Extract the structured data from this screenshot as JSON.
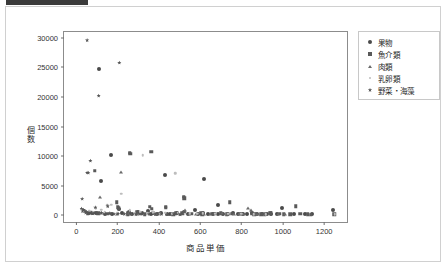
{
  "titlebar": {
    "text": ""
  },
  "chart_data": {
    "type": "scatter",
    "title": "",
    "xlabel": "商品単価",
    "ylabel": "個数",
    "xlim": [
      -60,
      1320
    ],
    "ylim": [
      -1500,
      31000
    ],
    "grid": false,
    "legend_position": "right",
    "xticks": [
      "0",
      "200",
      "400",
      "600",
      "800",
      "1000",
      "1200"
    ],
    "xtick_values": [
      0,
      200,
      400,
      600,
      800,
      1000,
      1200
    ],
    "yticks": [
      "0",
      "5000",
      "10000",
      "15000",
      "20000",
      "25000",
      "30000"
    ],
    "ytick_values": [
      0,
      5000,
      10000,
      15000,
      20000,
      25000,
      30000
    ],
    "series": [
      {
        "name": "果物",
        "marker": "circle",
        "color": "#4a4a4a",
        "points": [
          [
            108,
            24800
          ],
          [
            168,
            10100
          ],
          [
            118,
            5750
          ],
          [
            428,
            6850
          ],
          [
            618,
            6200
          ],
          [
            688,
            1800
          ],
          [
            995,
            1150
          ],
          [
            1242,
            950
          ],
          [
            205,
            1000
          ],
          [
            253,
            600
          ],
          [
            300,
            450
          ],
          [
            345,
            700
          ],
          [
            372,
            300
          ],
          [
            408,
            350
          ],
          [
            452,
            250
          ],
          [
            520,
            480
          ],
          [
            575,
            850
          ],
          [
            612,
            300
          ],
          [
            660,
            250
          ],
          [
            712,
            200
          ],
          [
            760,
            300
          ],
          [
            805,
            150
          ],
          [
            852,
            400
          ],
          [
            900,
            200
          ],
          [
            940,
            150
          ],
          [
            1052,
            250
          ],
          [
            1105,
            180
          ],
          [
            1140,
            120
          ],
          [
            95,
            300
          ],
          [
            140,
            250
          ],
          [
            62,
            420
          ],
          [
            75,
            350
          ],
          [
            172,
            260
          ],
          [
            222,
            380
          ],
          [
            268,
            220
          ],
          [
            318,
            300
          ],
          [
            362,
            180
          ],
          [
            392,
            240
          ],
          [
            438,
            160
          ],
          [
            485,
            280
          ],
          [
            540,
            200
          ],
          [
            588,
            170
          ],
          [
            636,
            220
          ],
          [
            684,
            140
          ],
          [
            735,
            190
          ],
          [
            782,
            160
          ],
          [
            828,
            130
          ],
          [
            875,
            210
          ],
          [
            925,
            150
          ],
          [
            972,
            120
          ]
        ]
      },
      {
        "name": "魚介類",
        "marker": "square",
        "color": "#595959",
        "points": [
          [
            362,
            10750
          ],
          [
            258,
            10600
          ],
          [
            260,
            10350
          ],
          [
            88,
            7500
          ],
          [
            520,
            3100
          ],
          [
            522,
            2900
          ],
          [
            196,
            2150
          ],
          [
            742,
            2200
          ],
          [
            1062,
            1500
          ],
          [
            355,
            1450
          ],
          [
            432,
            1400
          ],
          [
            432,
            1250
          ],
          [
            365,
            1050
          ],
          [
            200,
            1300
          ],
          [
            205,
            1150
          ],
          [
            292,
            500
          ],
          [
            938,
            400
          ],
          [
            942,
            300
          ],
          [
            512,
            350
          ],
          [
            558,
            250
          ],
          [
            605,
            300
          ],
          [
            655,
            200
          ],
          [
            700,
            350
          ],
          [
            752,
            250
          ],
          [
            800,
            200
          ],
          [
            848,
            300
          ],
          [
            895,
            180
          ],
          [
            985,
            250
          ],
          [
            1035,
            150
          ],
          [
            1085,
            200
          ],
          [
            1135,
            100
          ],
          [
            1248,
            180
          ],
          [
            55,
            280
          ],
          [
            105,
            320
          ],
          [
            152,
            260
          ],
          [
            248,
            300
          ],
          [
            308,
            220
          ],
          [
            400,
            260
          ],
          [
            470,
            180
          ],
          [
            480,
            330
          ],
          [
            610,
            160
          ],
          [
            670,
            240
          ],
          [
            728,
            140
          ],
          [
            790,
            220
          ],
          [
            860,
            120
          ],
          [
            912,
            180
          ],
          [
            1005,
            130
          ],
          [
            1120,
            160
          ],
          [
            248,
            150
          ],
          [
            330,
            140
          ]
        ]
      },
      {
        "name": "肉類",
        "marker": "triangle",
        "color": "#6a6a6a",
        "points": [
          [
            218,
            7300
          ],
          [
            112,
            3150
          ],
          [
            528,
            900
          ],
          [
            830,
            1150
          ],
          [
            845,
            900
          ],
          [
            255,
            350
          ],
          [
            262,
            250
          ],
          [
            348,
            300
          ],
          [
            438,
            200
          ],
          [
            545,
            250
          ],
          [
            620,
            180
          ],
          [
            705,
            300
          ],
          [
            762,
            150
          ],
          [
            805,
            200
          ],
          [
            868,
            250
          ],
          [
            920,
            130
          ],
          [
            975,
            180
          ],
          [
            1012,
            150
          ],
          [
            118,
            420
          ],
          [
            165,
            300
          ],
          [
            195,
            250
          ],
          [
            295,
            180
          ],
          [
            385,
            220
          ],
          [
            465,
            160
          ],
          [
            500,
            150
          ],
          [
            578,
            140
          ],
          [
            645,
            190
          ],
          [
            728,
            120
          ],
          [
            785,
            160
          ],
          [
            880,
            110
          ]
        ]
      },
      {
        "name": "乳卵類",
        "marker": "dot",
        "color": "#bdbdbd",
        "points": [
          [
            322,
            10100
          ],
          [
            478,
            7050
          ],
          [
            218,
            3650
          ],
          [
            168,
            1750
          ],
          [
            150,
            1650
          ],
          [
            95,
            1200
          ],
          [
            120,
            900
          ],
          [
            258,
            800
          ],
          [
            310,
            600
          ],
          [
            372,
            500
          ],
          [
            430,
            420
          ],
          [
            492,
            380
          ],
          [
            548,
            300
          ],
          [
            612,
            280
          ],
          [
            672,
            250
          ],
          [
            735,
            220
          ],
          [
            798,
            200
          ],
          [
            858,
            180
          ],
          [
            918,
            160
          ],
          [
            1252,
            120
          ],
          [
            62,
            700
          ],
          [
            78,
            550
          ],
          [
            138,
            480
          ],
          [
            198,
            400
          ],
          [
            282,
            350
          ],
          [
            345,
            300
          ],
          [
            405,
            260
          ],
          [
            465,
            240
          ],
          [
            525,
            220
          ],
          [
            585,
            200
          ]
        ]
      },
      {
        "name": "野菜・海藻",
        "marker": "star",
        "color": "#555555",
        "points": [
          [
            52,
            29600
          ],
          [
            208,
            25800
          ],
          [
            108,
            20200
          ],
          [
            68,
            9200
          ],
          [
            52,
            7200
          ],
          [
            58,
            7150
          ],
          [
            28,
            2750
          ],
          [
            152,
            1500
          ],
          [
            92,
            1300
          ],
          [
            35,
            900
          ],
          [
            42,
            700
          ],
          [
            48,
            550
          ],
          [
            72,
            450
          ],
          [
            88,
            350
          ],
          [
            102,
            300
          ],
          [
            122,
            400
          ],
          [
            142,
            250
          ],
          [
            162,
            300
          ],
          [
            182,
            200
          ],
          [
            202,
            250
          ],
          [
            232,
            180
          ],
          [
            262,
            220
          ],
          [
            288,
            150
          ],
          [
            318,
            200
          ],
          [
            352,
            160
          ],
          [
            382,
            140
          ],
          [
            412,
            180
          ],
          [
            442,
            120
          ],
          [
            472,
            160
          ],
          [
            502,
            100
          ],
          [
            25,
            1100
          ],
          [
            30,
            650
          ],
          [
            45,
            380
          ],
          [
            60,
            320
          ],
          [
            80,
            260
          ]
        ]
      }
    ]
  }
}
